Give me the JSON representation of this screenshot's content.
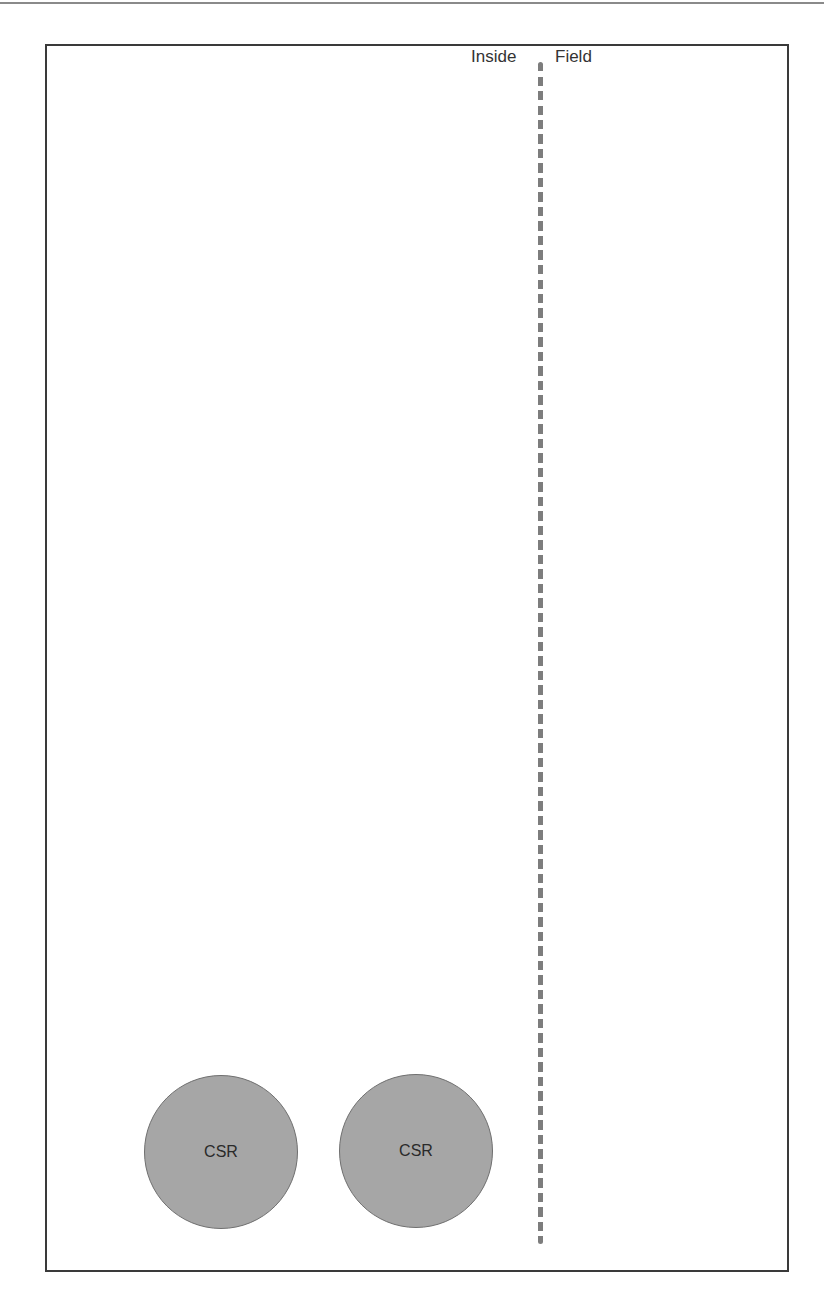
{
  "diagram": {
    "zones": [
      {
        "label": "Inside"
      },
      {
        "label": "Field"
      }
    ],
    "divider": {
      "style": "dashed",
      "color": "#7d7d7d"
    },
    "nodes": [
      {
        "label": "CSR",
        "fill": "#a6a6a6",
        "zone": "Inside"
      },
      {
        "label": "CSR",
        "fill": "#a6a6a6",
        "zone": "Inside"
      }
    ]
  }
}
